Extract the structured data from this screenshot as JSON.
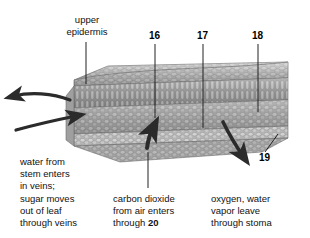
{
  "figure": {
    "background_color": "#ffffff",
    "text_color": "#111111"
  },
  "labels": {
    "upper_epidermis": "upper\nepidermis"
  },
  "numbers": {
    "n16": "16",
    "n17": "17",
    "n18": "18",
    "n19": "19",
    "n20": "20"
  },
  "captions": {
    "left": {
      "line1": "water from",
      "line2": "stem enters",
      "line3": "in veins;",
      "line4": "sugar moves",
      "line5": "out of leaf",
      "line6": "through veins"
    },
    "center": {
      "line1": "carbon dioxide",
      "line2": "from air enters",
      "line3_prefix": "through ",
      "line3_bold": "20"
    },
    "right": {
      "line1": "oxygen, water",
      "line2": "vapor leave",
      "line3": "through stoma"
    }
  },
  "arrows": {
    "water_out_left": "arrow pointing left out of leaf vein",
    "water_in_left": "arrow pointing right into leaf vein",
    "co2_in_bottom": "arrow pointing up into leaf underside",
    "o2_out_bottom": "arrow pointing down-right out of leaf underside"
  },
  "colors": {
    "leaf_epidermis": "#b3b3b3",
    "leaf_palisade": "#8f8f8f",
    "leaf_spongy": "#a6a6a6",
    "leaf_lower": "#bdbdbd",
    "outline": "#6b6b6b",
    "arrow_fill": "#2b2b2b",
    "leader_line": "#222222"
  }
}
